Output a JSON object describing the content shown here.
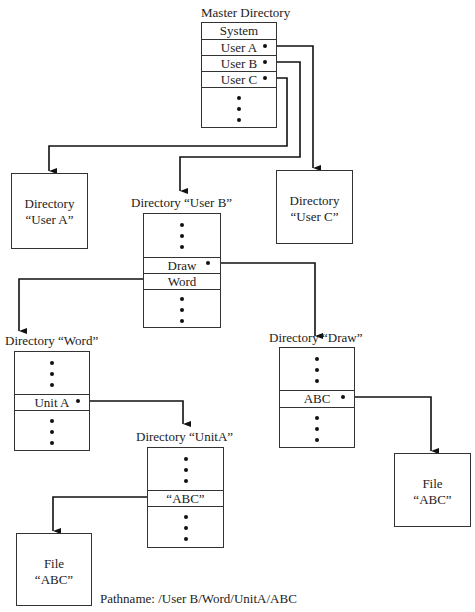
{
  "master": {
    "title": "Master Directory",
    "entries": [
      "System",
      "User A",
      "User B",
      "User C"
    ]
  },
  "dir_user_a": {
    "line1": "Directory",
    "line2": "“User A”"
  },
  "dir_user_c": {
    "line1": "Directory",
    "line2": "“User C”"
  },
  "dir_user_b": {
    "title": "Directory “User B”",
    "entries": [
      "Draw",
      "Word"
    ]
  },
  "dir_word": {
    "title": "Directory “Word”",
    "entries": [
      "Unit A"
    ]
  },
  "dir_draw": {
    "title": "Directory “Draw”",
    "entries": [
      "ABC"
    ]
  },
  "dir_unita": {
    "title": "Directory “UnitA”",
    "entries": [
      "“ABC”"
    ]
  },
  "file_left": {
    "line1": "File",
    "line2": "“ABC”"
  },
  "file_right": {
    "line1": "File",
    "line2": "“ABC”"
  },
  "pathname": "Pathname: /User B/Word/UnitA/ABC"
}
